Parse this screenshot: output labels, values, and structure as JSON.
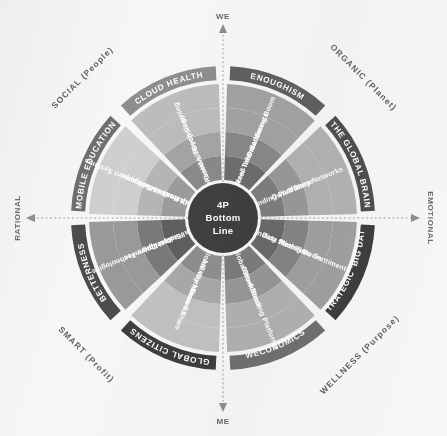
{
  "center": {
    "line1": "4P",
    "line2": "Bottom",
    "line3": "Line"
  },
  "axes": {
    "top": "WE",
    "bottom": "ME",
    "left": "RATIONAL",
    "right": "EMOTIONAL"
  },
  "quadrants": [
    {
      "id": "social",
      "label": "SOCIAL (People)"
    },
    {
      "id": "organic",
      "label": "ORGANIC (Planet)"
    },
    {
      "id": "wellness",
      "label": "WELLNESS (Purpose)"
    },
    {
      "id": "smart",
      "label": "SMART (Profit)"
    }
  ],
  "sectors": [
    {
      "id": "global-citizens",
      "outer": "GLOBAL CITIZENS",
      "rings": [
        "Mobile Global Workforce",
        "Affinity Networks",
        "Own 4 Share"
      ]
    },
    {
      "id": "betterness",
      "outer": "BETTERNESS",
      "rings": [
        "Cultural Storytelling",
        "Radical Openness",
        "Disruptive Technologies"
      ]
    },
    {
      "id": "mobile-education",
      "outer": "MOBILE EDUCATION",
      "rings": [
        "Empowered Code Builders",
        "Quantified-Self-apps",
        "Health Management Systems"
      ]
    },
    {
      "id": "cloud-health",
      "outer": "CLOUD HEALTH",
      "rings": [
        "The Good Life",
        "Positive Psychology",
        "Deep Learning"
      ]
    },
    {
      "id": "enoughism",
      "outer": "ENOUGHISM",
      "rings": [
        "Multi-Layered Information",
        "Real-Time Sentiments",
        "Data Mining Boom"
      ]
    },
    {
      "id": "the-global-brain",
      "outer": "THE GLOBAL BRAIN",
      "rings": [
        "Crowdfunding Platforms",
        "Own 4 Share",
        "Affinity Networks"
      ]
    },
    {
      "id": "strategic-big-data",
      "outer": "STRATEGIC 'BIG DATA'",
      "rings": [
        "Crowdfunding Platforms",
        "Data Mining Boom",
        "Real-Time Sentiments"
      ]
    },
    {
      "id": "weconomics",
      "outer": "WECONOMICS",
      "rings": [
        "Mobile Global Workforce",
        "Own 4 Share",
        "Crowdfunding Platforms"
      ]
    }
  ],
  "ring_labels_clockwise": [
    "Mobile Global Workforce",
    "Affinity Networks",
    "Cultural Storytelling",
    "Radical Openness",
    "Disruptive Technologies",
    "Empowered Code Builders",
    "Quantified-Self-apps",
    "Health Management Systems",
    "The Good Life",
    "Positive Psychology",
    "Deep Learning",
    "Multi-Layered Information",
    "Real-Time Sentiments",
    "Data Mining Boom",
    "Crowdfunding Platforms",
    "Own 4 Share"
  ],
  "colors": {
    "background": "#f7f7f5",
    "center_fill": "#3f3f3f",
    "band_outer": "#6e6e6e",
    "band_dark": "#4a4a4a",
    "band_mid": "#8a8a8a",
    "band_light": "#b4b4b4",
    "band_pale": "#d3d3d3",
    "text_light": "#ffffff",
    "text_dark": "#5f5f5f",
    "axis": "#8d8d8d"
  }
}
